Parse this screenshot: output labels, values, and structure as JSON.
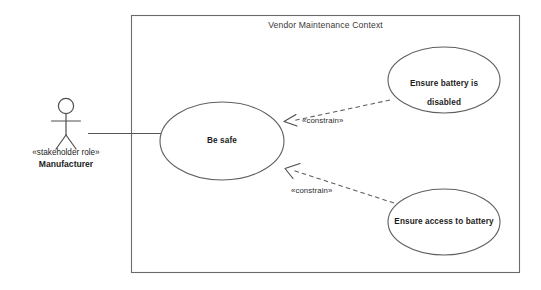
{
  "diagram": {
    "type": "uml-use-case-diagram",
    "title": "Vendor Maintenance Context",
    "stroke_color": "#5a5a5a",
    "text_color": "#1d1d1b",
    "background_color": "#ffffff",
    "boundary": {
      "name": "Vendor Maintenance Context",
      "x": 131,
      "y": 15,
      "width": 389,
      "height": 258
    },
    "actor": {
      "stereotype": "«stakeholder role»",
      "name": "Manufacturer",
      "icon": "stick-figure-actor-icon",
      "x": 66,
      "y": 125
    },
    "use_cases": [
      {
        "id": "be-safe",
        "label": "Be safe",
        "lines": [
          "Be safe"
        ],
        "cx": 222,
        "cy": 141,
        "rx": 62,
        "ry": 39
      },
      {
        "id": "ensure-battery-is-disabled",
        "label": "Ensure battery is disabled",
        "lines": [
          "Ensure battery is",
          "disabled"
        ],
        "cx": 444,
        "cy": 80,
        "rx": 56,
        "ry": 33
      },
      {
        "id": "ensure-access-to-battery",
        "label": "Ensure access to battery",
        "lines": [
          "Ensure access to battery"
        ],
        "cx": 444,
        "cy": 222,
        "rx": 56,
        "ry": 33
      }
    ],
    "associations": [
      {
        "id": "manufacturer-to-be-safe",
        "from": "Manufacturer",
        "to": "Be safe",
        "style": "solid",
        "arrow": "none"
      }
    ],
    "dependencies": [
      {
        "id": "constrain-battery-disabled",
        "label": "«constrain»",
        "from": "Ensure battery is disabled",
        "to": "Be safe",
        "style": "dashed",
        "arrow": "open",
        "label_x": 305,
        "label_y": 116
      },
      {
        "id": "constrain-access-to-battery",
        "label": "«constrain»",
        "from": "Ensure access to battery",
        "to": "Be safe",
        "style": "dashed",
        "arrow": "open",
        "label_x": 293,
        "label_y": 186
      }
    ]
  }
}
